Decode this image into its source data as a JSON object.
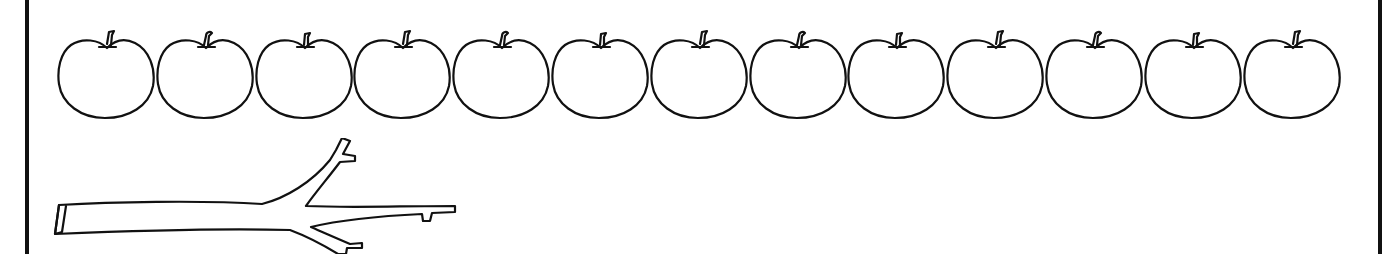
{
  "worksheet": {
    "description": "Counting worksheet: a row of apples and a bare branch",
    "apple_count": 13,
    "apples": [
      {
        "index": 1,
        "icon": "apple-icon"
      },
      {
        "index": 2,
        "icon": "apple-icon"
      },
      {
        "index": 3,
        "icon": "apple-icon"
      },
      {
        "index": 4,
        "icon": "apple-icon"
      },
      {
        "index": 5,
        "icon": "apple-icon"
      },
      {
        "index": 6,
        "icon": "apple-icon"
      },
      {
        "index": 7,
        "icon": "apple-icon"
      },
      {
        "index": 8,
        "icon": "apple-icon"
      },
      {
        "index": 9,
        "icon": "apple-icon"
      },
      {
        "index": 10,
        "icon": "apple-icon"
      },
      {
        "index": 11,
        "icon": "apple-icon"
      },
      {
        "index": 12,
        "icon": "apple-icon"
      },
      {
        "index": 13,
        "icon": "apple-icon"
      }
    ],
    "branch": {
      "icon": "branch-icon"
    },
    "colors": {
      "stroke": "#111111",
      "background": "#ffffff"
    }
  }
}
